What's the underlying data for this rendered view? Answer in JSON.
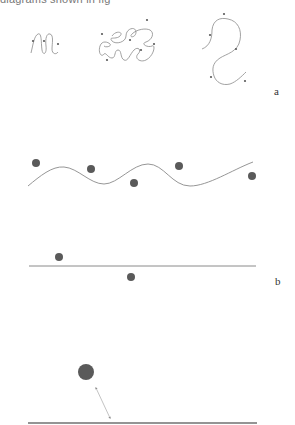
{
  "figure": {
    "caption_fragment": "diagrams shown in fig",
    "panels": [
      {
        "label": "a",
        "description": "Three polymer-like curves of decreasing compactness with sparse surrounding particles",
        "items": [
          {
            "name": "compact-coil",
            "particles": 3
          },
          {
            "name": "tangled-coil",
            "particles": 6
          },
          {
            "name": "extended-s-curve",
            "particles": 5
          }
        ]
      },
      {
        "label": "b",
        "description": "Particles around a wavy curve and around a straight line",
        "items": [
          {
            "name": "wavy-curve",
            "particles": 5
          },
          {
            "name": "straight-line",
            "particles": 2
          }
        ]
      },
      {
        "label": "",
        "description": "Single particle with double-headed distance arrow to a line",
        "items": [
          {
            "name": "base-line",
            "particles": 1
          }
        ]
      }
    ]
  },
  "colors": {
    "curve": "#8a8a8a",
    "particle": "#5a5a5a",
    "line_thick": "#707070",
    "label": "#333333"
  }
}
